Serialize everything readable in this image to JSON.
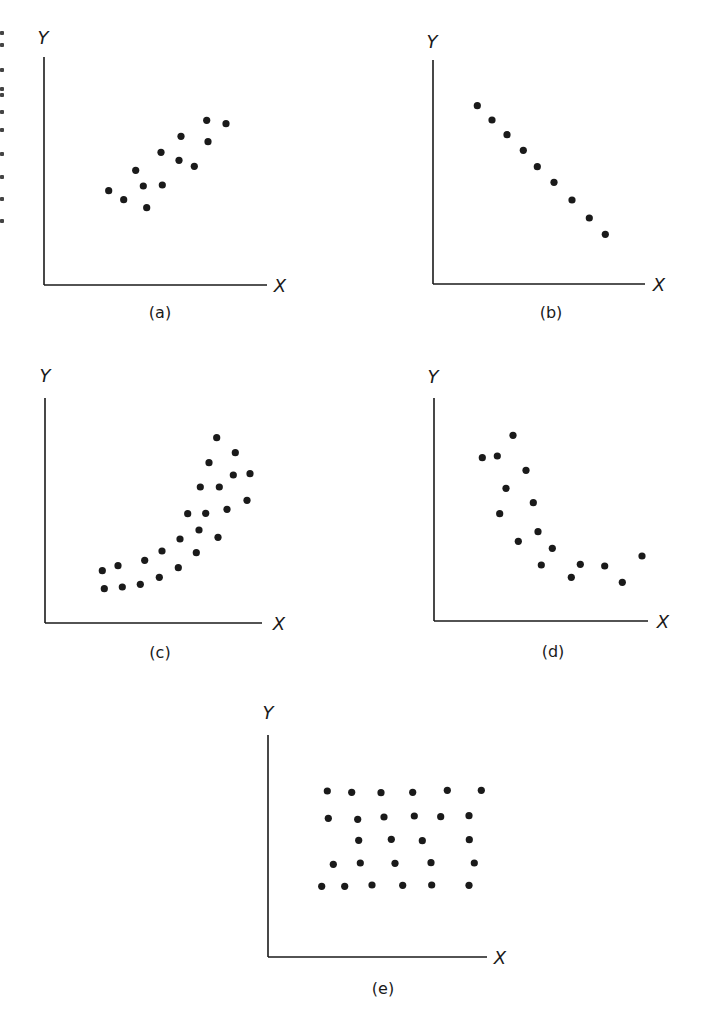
{
  "figure": {
    "background": "#ffffff",
    "ink_color": "#1a1a1a",
    "dot_radius": 3.6
  },
  "chart_data": [
    {
      "type": "scatter",
      "id": "a",
      "caption": "(a)",
      "xlabel": "X",
      "ylabel": "Y",
      "description": "positive linear relationship with moderate scatter",
      "grid": false,
      "ticks": false,
      "frame": {
        "origin": [
          44,
          285
        ],
        "y_top": 57,
        "x_end": 267,
        "ylabel_pos": [
          43,
          44
        ],
        "xlabel_pos": [
          280,
          292
        ],
        "caption_pos": [
          160,
          318
        ]
      },
      "points": [
        [
          108.7,
          190.7
        ],
        [
          123.7,
          199.7
        ],
        [
          135.7,
          170.3
        ],
        [
          143.3,
          186
        ],
        [
          146.7,
          207.7
        ],
        [
          161,
          152.3
        ],
        [
          162.3,
          185
        ],
        [
          181,
          136.3
        ],
        [
          179,
          160.3
        ],
        [
          194.3,
          166.3
        ],
        [
          206.7,
          120.3
        ],
        [
          208,
          141.7
        ],
        [
          226,
          123.7
        ]
      ]
    },
    {
      "type": "scatter",
      "id": "b",
      "caption": "(b)",
      "xlabel": "X",
      "ylabel": "Y",
      "description": "perfect negative linear relationship",
      "grid": false,
      "ticks": false,
      "frame": {
        "origin": [
          433,
          284
        ],
        "y_top": 60,
        "x_end": 645,
        "ylabel_pos": [
          432,
          48
        ],
        "xlabel_pos": [
          659,
          291
        ],
        "caption_pos": [
          551,
          318
        ]
      },
      "points": [
        [
          477.3,
          105.7
        ],
        [
          492,
          120
        ],
        [
          507,
          134.7
        ],
        [
          523.3,
          150.3
        ],
        [
          537.3,
          166.7
        ],
        [
          554,
          182.3
        ],
        [
          572,
          200
        ],
        [
          589.3,
          218
        ],
        [
          605.3,
          234.3
        ]
      ]
    },
    {
      "type": "scatter",
      "id": "c",
      "caption": "(c)",
      "xlabel": "X",
      "ylabel": "Y",
      "description": "positive curvilinear (exponential-like) relationship",
      "grid": false,
      "ticks": false,
      "frame": {
        "origin": [
          45,
          623
        ],
        "y_top": 398,
        "x_end": 262,
        "ylabel_pos": [
          45,
          382
        ],
        "xlabel_pos": [
          279,
          630
        ],
        "caption_pos": [
          160,
          658
        ]
      },
      "points": [
        [
          102.3,
          570.7
        ],
        [
          104.3,
          588.7
        ],
        [
          118,
          565.7
        ],
        [
          122.3,
          587
        ],
        [
          144.7,
          560.3
        ],
        [
          140.3,
          584.3
        ],
        [
          162,
          551
        ],
        [
          159.3,
          577.3
        ],
        [
          180,
          539
        ],
        [
          178.3,
          567.7
        ],
        [
          187.7,
          513.7
        ],
        [
          196.3,
          552.7
        ],
        [
          199,
          530
        ],
        [
          200.3,
          487
        ],
        [
          205.7,
          513.3
        ],
        [
          209,
          462.7
        ],
        [
          216.7,
          437.7
        ],
        [
          219.3,
          487
        ],
        [
          218,
          537.3
        ],
        [
          227,
          509.3
        ],
        [
          233.3,
          475
        ],
        [
          235.3,
          452.7
        ],
        [
          247,
          500.3
        ],
        [
          250,
          473.7
        ]
      ]
    },
    {
      "type": "scatter",
      "id": "d",
      "caption": "(d)",
      "xlabel": "X",
      "ylabel": "Y",
      "description": "negative curvilinear relationship",
      "grid": false,
      "ticks": false,
      "frame": {
        "origin": [
          434,
          621
        ],
        "y_top": 398,
        "x_end": 648,
        "ylabel_pos": [
          433,
          383
        ],
        "xlabel_pos": [
          663,
          628
        ],
        "caption_pos": [
          553,
          657
        ]
      },
      "points": [
        [
          482.3,
          457.7
        ],
        [
          497.3,
          456
        ],
        [
          513,
          435.3
        ],
        [
          526,
          470.3
        ],
        [
          506,
          488.3
        ],
        [
          533.3,
          502.7
        ],
        [
          499.7,
          513.7
        ],
        [
          538,
          531.7
        ],
        [
          518.3,
          541.3
        ],
        [
          552.3,
          548.3
        ],
        [
          541.3,
          565
        ],
        [
          580.3,
          564.3
        ],
        [
          571.3,
          577.3
        ],
        [
          604.7,
          566
        ],
        [
          622.3,
          582.3
        ],
        [
          642,
          556
        ]
      ]
    },
    {
      "type": "scatter",
      "id": "e",
      "caption": "(e)",
      "xlabel": "X",
      "ylabel": "Y",
      "description": "no relationship (uniform grid-like scatter)",
      "grid": false,
      "ticks": false,
      "frame": {
        "origin": [
          268,
          957
        ],
        "y_top": 735,
        "x_end": 487,
        "ylabel_pos": [
          268,
          719
        ],
        "xlabel_pos": [
          500,
          964
        ],
        "caption_pos": [
          383,
          994
        ]
      },
      "points": [
        [
          327.3,
          791
        ],
        [
          351.7,
          792.3
        ],
        [
          381,
          792.7
        ],
        [
          412.7,
          792.3
        ],
        [
          447.3,
          790.3
        ],
        [
          481.3,
          790.3
        ],
        [
          328.3,
          818.3
        ],
        [
          357.7,
          819.3
        ],
        [
          384,
          817
        ],
        [
          414.3,
          816
        ],
        [
          440.7,
          816.7
        ],
        [
          469,
          815.7
        ],
        [
          358.7,
          840.3
        ],
        [
          391.3,
          839.3
        ],
        [
          422.3,
          840.7
        ],
        [
          469.3,
          839.7
        ],
        [
          333.3,
          864.3
        ],
        [
          360.3,
          863
        ],
        [
          395,
          863.3
        ],
        [
          431,
          862.7
        ],
        [
          474.3,
          863
        ],
        [
          321.7,
          886.3
        ],
        [
          344.7,
          886.3
        ],
        [
          372,
          885
        ],
        [
          402.7,
          885.3
        ],
        [
          431.7,
          885
        ],
        [
          469,
          885.3
        ]
      ]
    }
  ],
  "margin_marks_y": [
    31,
    43,
    68,
    87,
    93,
    110,
    128,
    152,
    175,
    197,
    219
  ]
}
